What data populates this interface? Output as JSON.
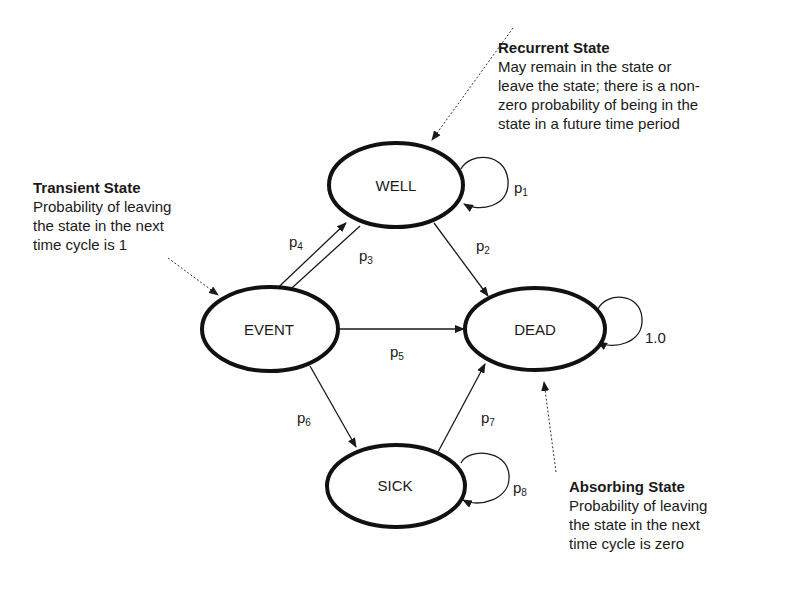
{
  "annotations": {
    "recurrent": {
      "title": "Recurrent State",
      "lines": [
        "May remain in the state or",
        "leave the state; there is a non-",
        "zero probability of being in the",
        "state in a future time period"
      ]
    },
    "transient": {
      "title": "Transient State",
      "lines": [
        "Probability of leaving",
        "the state in the next",
        "time cycle is 1"
      ]
    },
    "absorbing": {
      "title": "Absorbing State",
      "lines": [
        "Probability of leaving",
        "the state in the next",
        "time cycle is zero"
      ]
    }
  },
  "nodes": {
    "well": "WELL",
    "event": "EVENT",
    "dead": "DEAD",
    "sick": "SICK"
  },
  "edges": {
    "p1": {
      "base": "p",
      "sub": "1",
      "from": "WELL",
      "to": "WELL"
    },
    "p2": {
      "base": "p",
      "sub": "2",
      "from": "WELL",
      "to": "DEAD"
    },
    "p3": {
      "base": "p",
      "sub": "3",
      "from": "WELL",
      "to": "EVENT"
    },
    "p4": {
      "base": "p",
      "sub": "4",
      "from": "EVENT",
      "to": "WELL"
    },
    "p5": {
      "base": "p",
      "sub": "5",
      "from": "EVENT",
      "to": "DEAD"
    },
    "p6": {
      "base": "p",
      "sub": "6",
      "from": "EVENT",
      "to": "SICK"
    },
    "p7": {
      "base": "p",
      "sub": "7",
      "from": "SICK",
      "to": "DEAD"
    },
    "p8": {
      "base": "p",
      "sub": "8",
      "from": "SICK",
      "to": "SICK"
    },
    "dead_self": {
      "label": "1.0",
      "from": "DEAD",
      "to": "DEAD"
    }
  }
}
